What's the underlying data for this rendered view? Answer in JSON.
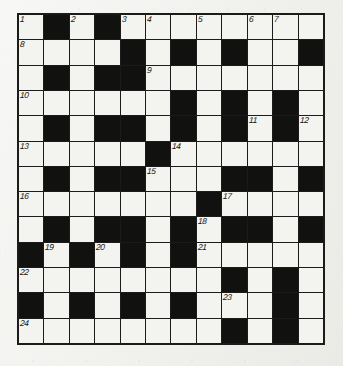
{
  "puzzle": {
    "title": "Crossword Grid",
    "type": "crossword",
    "rows": 12,
    "columns": 12,
    "colors": {
      "block": "#111110",
      "cell": "#f3f3ef",
      "grid_line": "#1b1b1b",
      "page": "#eeeeea",
      "number_text": "#141414"
    },
    "grid": [
      [
        "W",
        "B",
        "W",
        "B",
        "W",
        "W",
        "W",
        "W",
        "W",
        "W",
        "W",
        "W"
      ],
      [
        "W",
        "W",
        "W",
        "W",
        "B",
        "W",
        "B",
        "W",
        "B",
        "W",
        "W",
        "B"
      ],
      [
        "W",
        "B",
        "W",
        "B",
        "B",
        "W",
        "W",
        "W",
        "W",
        "W",
        "W",
        "W"
      ],
      [
        "W",
        "W",
        "W",
        "W",
        "W",
        "W",
        "B",
        "W",
        "B",
        "W",
        "B",
        "W"
      ],
      [
        "W",
        "B",
        "W",
        "B",
        "B",
        "W",
        "B",
        "W",
        "B",
        "W",
        "B",
        "W"
      ],
      [
        "W",
        "W",
        "W",
        "W",
        "W",
        "B",
        "W",
        "W",
        "W",
        "W",
        "W",
        "W"
      ],
      [
        "W",
        "B",
        "W",
        "B",
        "B",
        "W",
        "W",
        "W",
        "B",
        "B",
        "W",
        "B"
      ],
      [
        "W",
        "W",
        "W",
        "W",
        "W",
        "W",
        "W",
        "B",
        "W",
        "W",
        "W",
        "W"
      ],
      [
        "W",
        "B",
        "W",
        "B",
        "B",
        "W",
        "B",
        "W",
        "B",
        "B",
        "W",
        "B"
      ],
      [
        "B",
        "W",
        "B",
        "W",
        "B",
        "W",
        "B",
        "W",
        "W",
        "W",
        "W",
        "W"
      ],
      [
        "W",
        "W",
        "W",
        "W",
        "W",
        "W",
        "W",
        "W",
        "B",
        "W",
        "B",
        "W"
      ],
      [
        "B",
        "W",
        "B",
        "W",
        "B",
        "W",
        "B",
        "W",
        "W",
        "W",
        "B",
        "W"
      ],
      [
        "W",
        "W",
        "W",
        "W",
        "W",
        "W",
        "W",
        "W",
        "B",
        "W",
        "B",
        "W"
      ]
    ],
    "numbers": [
      {
        "row": 0,
        "col": 0,
        "label": "1"
      },
      {
        "row": 0,
        "col": 2,
        "label": "2"
      },
      {
        "row": 0,
        "col": 4,
        "label": "3"
      },
      {
        "row": 0,
        "col": 5,
        "label": "4"
      },
      {
        "row": 0,
        "col": 7,
        "label": "5"
      },
      {
        "row": 0,
        "col": 9,
        "label": "6"
      },
      {
        "row": 0,
        "col": 10,
        "label": "7"
      },
      {
        "row": 1,
        "col": 0,
        "label": "8"
      },
      {
        "row": 2,
        "col": 5,
        "label": "9"
      },
      {
        "row": 3,
        "col": 0,
        "label": "10"
      },
      {
        "row": 4,
        "col": 9,
        "label": "11"
      },
      {
        "row": 4,
        "col": 11,
        "label": "12"
      },
      {
        "row": 5,
        "col": 0,
        "label": "13"
      },
      {
        "row": 5,
        "col": 6,
        "label": "14"
      },
      {
        "row": 6,
        "col": 5,
        "label": "15"
      },
      {
        "row": 7,
        "col": 0,
        "label": "16"
      },
      {
        "row": 7,
        "col": 8,
        "label": "17"
      },
      {
        "row": 8,
        "col": 7,
        "label": "18"
      },
      {
        "row": 9,
        "col": 1,
        "label": "19"
      },
      {
        "row": 9,
        "col": 3,
        "label": "20"
      },
      {
        "row": 9,
        "col": 7,
        "label": "21"
      },
      {
        "row": 10,
        "col": 0,
        "label": "22"
      },
      {
        "row": 11,
        "col": 8,
        "label": "23"
      },
      {
        "row": 12,
        "col": 0,
        "label": "24"
      }
    ]
  }
}
